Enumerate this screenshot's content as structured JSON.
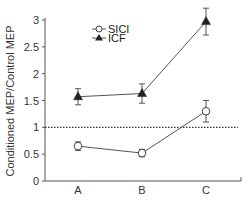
{
  "chart_data": {
    "type": "line",
    "title": "",
    "xlabel": "",
    "ylabel": "Conditioned MEP/Control MEP",
    "categories": [
      "A",
      "B",
      "C"
    ],
    "ylim": [
      0,
      3
    ],
    "yticks": [
      0,
      0.5,
      1,
      1.5,
      2,
      2.5,
      3
    ],
    "ytick_labels": [
      "0",
      "0.5",
      "1",
      "1.5",
      "2",
      "2.5",
      "3"
    ],
    "grid": false,
    "legend_position": "upper-left-inside",
    "reference_line": {
      "y": 1,
      "style": "dotted"
    },
    "series": [
      {
        "name": "SICI",
        "marker": "open-circle",
        "values": [
          0.65,
          0.52,
          1.3
        ],
        "errors": [
          0.08,
          0.07,
          0.2
        ]
      },
      {
        "name": "ICF",
        "marker": "filled-triangle",
        "values": [
          1.57,
          1.63,
          2.97
        ],
        "errors": [
          0.15,
          0.18,
          0.25
        ]
      }
    ],
    "colors": {
      "line": "#555555",
      "axis": "#555555",
      "text": "#333333",
      "marker_fill": "#222222"
    }
  }
}
